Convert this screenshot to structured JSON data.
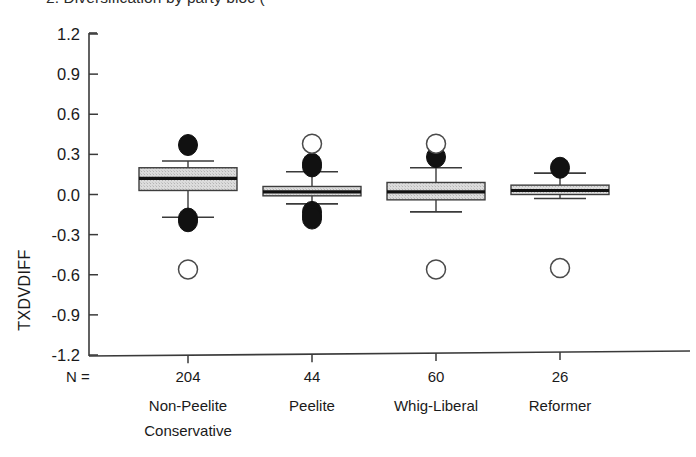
{
  "figure": {
    "title_clipped": "2. Diversification by party bloc (",
    "background": "#ffffff",
    "frame_color": "#3a3a3a"
  },
  "axes": {
    "ylabel": "TXDVDIFF",
    "n_prefix": "N =",
    "ytick_labels": [
      "1.2",
      "0.9",
      "0.6",
      "0.3",
      "0.0",
      "-0.3",
      "-0.6",
      "-0.9",
      "-1.2"
    ]
  },
  "chart_data": {
    "type": "box",
    "title": "2. Diversification by party bloc (",
    "xlabel": "",
    "ylabel": "TXDVDIFF",
    "ylim": [
      -1.2,
      1.2
    ],
    "yticks": [
      1.2,
      0.9,
      0.6,
      0.3,
      0.0,
      -0.3,
      -0.6,
      -0.9,
      -1.2
    ],
    "grid": false,
    "legend": "none",
    "categories": [
      "Non-Peelite Conservative",
      "Peelite",
      "Whig-Liberal",
      "Reformer"
    ],
    "category_lines": [
      [
        "Non-Peelite",
        "Conservative"
      ],
      [
        "Peelite"
      ],
      [
        "Whig-Liberal"
      ],
      [
        "Reformer"
      ]
    ],
    "counts": [
      204,
      44,
      60,
      26
    ],
    "boxes": [
      {
        "category": "Non-Peelite Conservative",
        "n": 204,
        "whisker_low": -0.17,
        "q1": 0.03,
        "median": 0.12,
        "q3": 0.2,
        "whisker_high": 0.25,
        "outliers_filled": [
          0.37,
          -0.18,
          -0.2
        ],
        "outliers_open": [
          -0.56
        ]
      },
      {
        "category": "Peelite",
        "n": 44,
        "whisker_low": -0.07,
        "q1": -0.01,
        "median": 0.02,
        "q3": 0.06,
        "whisker_high": 0.17,
        "outliers_filled": [
          0.23,
          0.21,
          -0.13,
          -0.16,
          -0.18
        ],
        "outliers_open": [
          0.38
        ]
      },
      {
        "category": "Whig-Liberal",
        "n": 60,
        "whisker_low": -0.13,
        "q1": -0.04,
        "median": 0.02,
        "q3": 0.09,
        "whisker_high": 0.2,
        "outliers_filled": [
          0.28
        ],
        "outliers_open": [
          0.38,
          -0.56
        ]
      },
      {
        "category": "Reformer",
        "n": 26,
        "whisker_low": -0.03,
        "q1": 0.0,
        "median": 0.03,
        "q3": 0.07,
        "whisker_high": 0.16,
        "outliers_filled": [
          0.2
        ],
        "outliers_open": [
          -0.55
        ]
      }
    ]
  }
}
